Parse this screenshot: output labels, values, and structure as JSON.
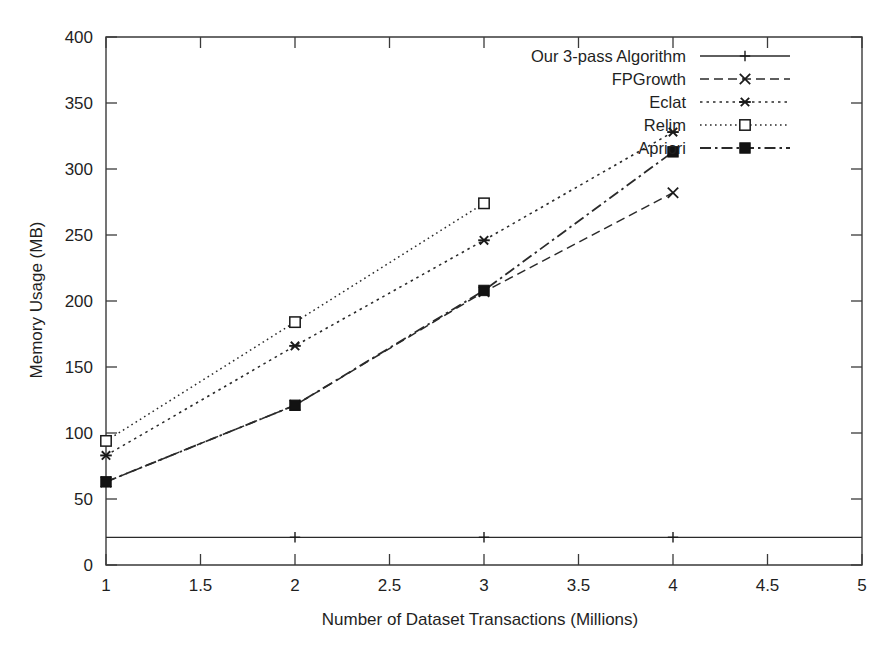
{
  "chart_data": {
    "type": "line",
    "title": "",
    "xlabel": "Number of Dataset Transactions (Millions)",
    "ylabel": "Memory Usage (MB)",
    "xlim": [
      1,
      5
    ],
    "ylim": [
      0,
      400
    ],
    "xticks": [
      "1",
      "1.5",
      "2",
      "2.5",
      "3",
      "3.5",
      "4",
      "4.5",
      "5"
    ],
    "xtick_values": [
      1,
      1.5,
      2,
      2.5,
      3,
      3.5,
      4,
      4.5,
      5
    ],
    "yticks": [
      "0",
      "50",
      "100",
      "150",
      "200",
      "250",
      "300",
      "350",
      "400"
    ],
    "ytick_values": [
      0,
      50,
      100,
      150,
      200,
      250,
      300,
      350,
      400
    ],
    "grid": false,
    "legend_position": "top-right",
    "series": [
      {
        "name": "Our 3-pass Algorithm",
        "marker": "plus",
        "dash": "none",
        "x": [
          1,
          2,
          3,
          4,
          5
        ],
        "values": [
          21,
          21,
          21,
          21,
          21
        ]
      },
      {
        "name": "FPGrowth",
        "marker": "cross",
        "dash": "dashed",
        "x": [
          1,
          2,
          3,
          4
        ],
        "values": [
          63,
          121,
          207,
          282
        ]
      },
      {
        "name": "Eclat",
        "marker": "asterisk",
        "dash": "dotted",
        "x": [
          1,
          2,
          3,
          4
        ],
        "values": [
          83,
          166,
          246,
          328
        ]
      },
      {
        "name": "Relim",
        "marker": "open-square",
        "dash": "fine-dotted",
        "x": [
          1,
          2,
          3
        ],
        "values": [
          94,
          184,
          274
        ]
      },
      {
        "name": "Apriori",
        "marker": "filled-square",
        "dash": "dash-dot",
        "x": [
          1,
          2,
          3,
          4
        ],
        "values": [
          63,
          121,
          208,
          313
        ]
      }
    ]
  },
  "legend": {
    "entries": [
      {
        "label": "Our 3-pass Algorithm"
      },
      {
        "label": "FPGrowth"
      },
      {
        "label": "Eclat"
      },
      {
        "label": "Relim"
      },
      {
        "label": "Apriori"
      }
    ]
  },
  "colors": {
    "ink": "#2a2a2a",
    "background": "#ffffff"
  }
}
